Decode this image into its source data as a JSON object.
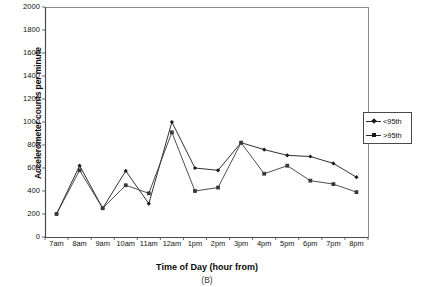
{
  "chart_data": {
    "type": "line",
    "title": "",
    "caption": "(B)",
    "xlabel": "Time of Day (hour from)",
    "ylabel": "Accelerometer counts per minute",
    "categories": [
      "7am",
      "8am",
      "9am",
      "10am",
      "11am",
      "12am",
      "1pm",
      "2pm",
      "3pm",
      "4pm",
      "5pm",
      "6pm",
      "7pm",
      "8pm"
    ],
    "ylim": [
      0,
      2000
    ],
    "yticks": [
      0,
      200,
      400,
      600,
      800,
      1000,
      1200,
      1400,
      1600,
      1800,
      2000
    ],
    "grid": false,
    "legend_position": "right",
    "series": [
      {
        "name": "<95th",
        "marker": "diamond",
        "color": "#1a1a1a",
        "values": [
          200,
          620,
          250,
          575,
          290,
          1000,
          600,
          580,
          820,
          760,
          710,
          700,
          640,
          520
        ]
      },
      {
        "name": ">95th",
        "marker": "square",
        "color": "#3a3a3a",
        "values": [
          200,
          580,
          250,
          450,
          380,
          910,
          400,
          430,
          820,
          550,
          620,
          490,
          460,
          390
        ]
      }
    ]
  }
}
